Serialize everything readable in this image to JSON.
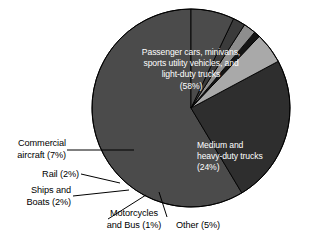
{
  "chart_data": {
    "type": "pie",
    "title": "",
    "subtitle": "",
    "xlabel": "",
    "ylabel": "",
    "legend_position": "none",
    "grid": false,
    "units": "percent",
    "total": 99,
    "categories": [
      "Passenger cars, minivans, sports utility vehicles, and light-duty trucks",
      "Medium and heavy-duty trucks",
      "Other",
      "Motorcycles and Bus",
      "Ships and Boats",
      "Rail",
      "Commercial aircraft"
    ],
    "values": [
      58,
      24,
      5,
      1,
      2,
      2,
      7
    ],
    "slices": [
      {
        "key": "passenger-cars",
        "label": "Passenger cars, minivans,\nsports utility vehicles, and\nlight-duty trucks\n(58%)",
        "name": "Passenger cars, minivans, sports utility vehicles, and light-duty trucks",
        "value": 58,
        "percent_text": "(58%)",
        "color": "#4b4b4b",
        "label_placement": "inside",
        "text_color": "#ffffff"
      },
      {
        "key": "medium-heavy-trucks",
        "label": "Medium and\nheavy-duty trucks\n(24%)",
        "name": "Medium and heavy-duty trucks",
        "value": 24,
        "percent_text": "(24%)",
        "color": "#2e2e2e",
        "label_placement": "inside",
        "text_color": "#ffffff"
      },
      {
        "key": "other",
        "label": "Other (5%)",
        "name": "Other",
        "value": 5,
        "percent_text": "(5%)",
        "color": "#a9a9a9",
        "label_placement": "outside",
        "text_color": "#000000"
      },
      {
        "key": "motorcycles-bus",
        "label": "Motorcycles\nand Bus (1%)",
        "name": "Motorcycles and Bus",
        "value": 1,
        "percent_text": "(1%)",
        "color": "#151515",
        "label_placement": "outside",
        "text_color": "#000000"
      },
      {
        "key": "ships-boats",
        "label": "Ships and\nBoats (2%)",
        "name": "Ships and Boats",
        "value": 2,
        "percent_text": "(2%)",
        "color": "#8e8e8e",
        "label_placement": "outside",
        "text_color": "#000000"
      },
      {
        "key": "rail",
        "label": "Rail (2%)",
        "name": "Rail",
        "value": 2,
        "percent_text": "(2%)",
        "color": "#3b3b3b",
        "label_placement": "outside",
        "text_color": "#000000"
      },
      {
        "key": "commercial-aircraft",
        "label": "Commercial\naircraft (7%)",
        "name": "Commercial aircraft",
        "value": 7,
        "percent_text": "(7%)",
        "color": "#4b4b4b",
        "label_placement": "outside",
        "text_color": "#000000"
      }
    ],
    "geometry": {
      "center_x": 191,
      "center_y": 108,
      "radius": 99,
      "start_angle_deg": -90,
      "direction": "counterclockwise"
    },
    "colors": {
      "background": "#ffffff",
      "outline": "#000000",
      "inside_text": "#ffffff",
      "outside_text": "#000000",
      "leader_line": "#000000"
    }
  }
}
